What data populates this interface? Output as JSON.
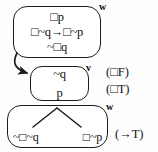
{
  "diagram": {
    "type": "modal-logic-tableau",
    "nodes": [
      {
        "id": "w-top",
        "world_label": "w",
        "lines": [
          "□p",
          "□~q→□~p",
          "~□q"
        ]
      },
      {
        "id": "v-mid",
        "world_label": "v",
        "lines": [
          "~q",
          "p"
        ]
      },
      {
        "id": "w-bot",
        "world_label": "w",
        "branches": [
          "~□~q",
          "□~p"
        ]
      }
    ],
    "annotations": [
      {
        "id": "box-f",
        "text": "(□F)"
      },
      {
        "id": "box-t",
        "text": "(□T)"
      },
      {
        "id": "arrow-t",
        "text": "(→T)"
      }
    ],
    "edges": [
      {
        "id": "accessibility-arrow",
        "from": "w-top",
        "to": "v-mid",
        "style": "curved-arrow"
      },
      {
        "id": "branch-split",
        "from": "w-bot-top",
        "to": "w-bot-branches",
        "style": "v-fork"
      }
    ],
    "colors": {
      "stroke": "#1c1c1c",
      "text": "#111111",
      "background": "#fdfdfd",
      "box_fill": "#ffffff"
    }
  }
}
